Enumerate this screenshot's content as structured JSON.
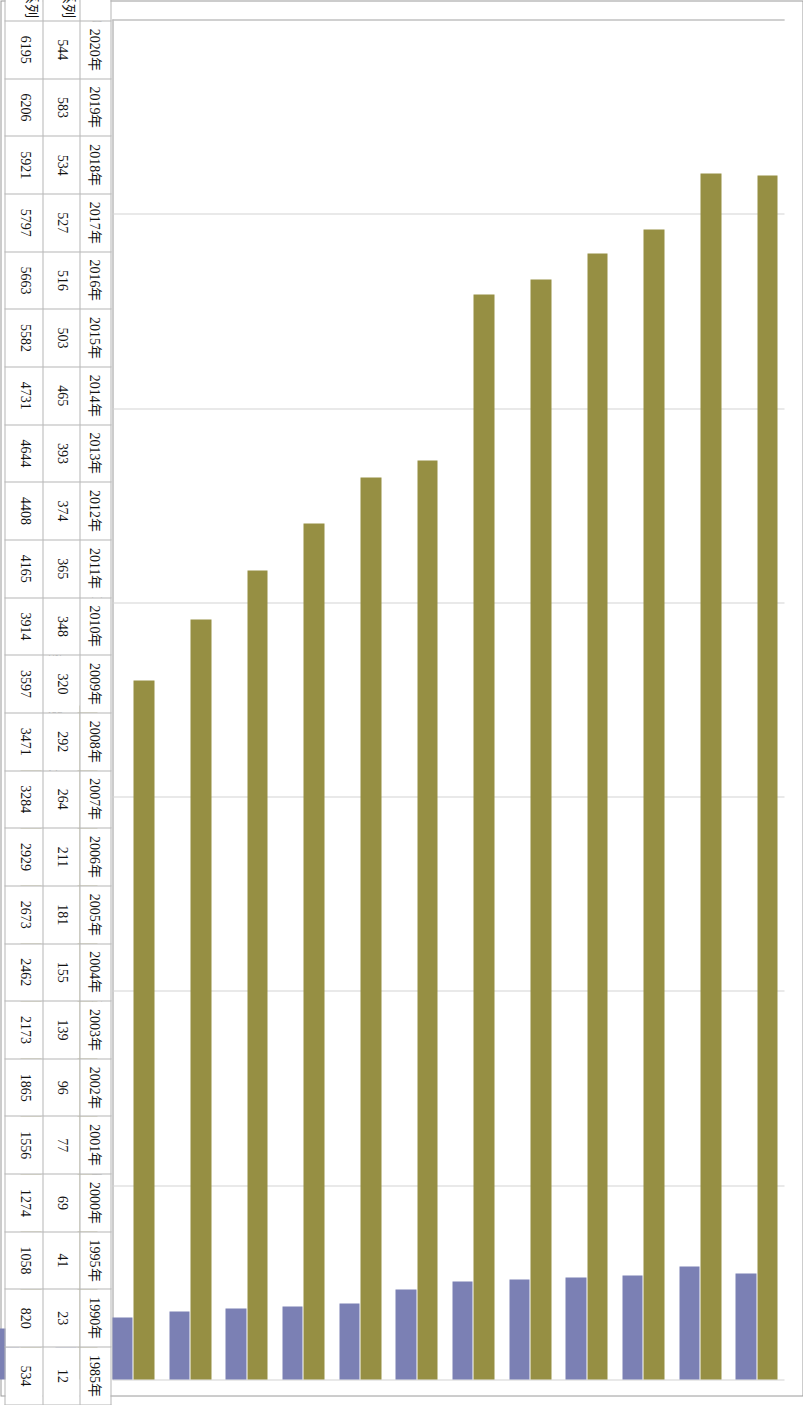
{
  "chart_data": {
    "type": "bar",
    "orientation": "horizontal-rotated",
    "title": "",
    "xlabel": "历年铁路电报辑设（条/千米）",
    "ylabel": "",
    "ylim": [
      0,
      7000
    ],
    "axis_ticks": [
      7000,
      6000,
      5000,
      4000,
      3000,
      2000,
      1000,
      0
    ],
    "grid": true,
    "legend_position": "data-table",
    "categories": [
      "2020年",
      "2019年",
      "2018年",
      "2017年",
      "2016年",
      "2015年",
      "2014年",
      "2013年",
      "2012年",
      "2011年",
      "2010年",
      "2009年",
      "2008年",
      "2007年",
      "2006年",
      "2005年",
      "2004年",
      "2003年",
      "2002年",
      "2001年",
      "2000年",
      "1995年",
      "1990年",
      "1985年"
    ],
    "series": [
      {
        "name": "系列1",
        "color": "#7b80b4",
        "values": [
          544,
          583,
          534,
          527,
          516,
          503,
          465,
          393,
          374,
          365,
          348,
          320,
          292,
          264,
          211,
          181,
          155,
          139,
          96,
          77,
          69,
          41,
          23,
          12
        ]
      },
      {
        "name": "系列2",
        "color": "#968f43",
        "values": [
          6195,
          6206,
          5921,
          5797,
          5663,
          5582,
          4731,
          4644,
          4408,
          4165,
          3914,
          3597,
          3471,
          3284,
          2929,
          2673,
          2462,
          2173,
          1865,
          1556,
          1274,
          1058,
          820,
          534
        ]
      }
    ]
  },
  "colors": {
    "series1": "#7b80b4",
    "series2": "#968f43",
    "grid": "#d3d3d3",
    "axis": "#9a9a9a",
    "table_border": "#b5b5b5",
    "background": "#ffffff"
  },
  "table": {
    "row_labels": [
      "系列1",
      "系列2"
    ],
    "legend_swatches": [
      "series1-swatch",
      "series2-swatch"
    ]
  }
}
